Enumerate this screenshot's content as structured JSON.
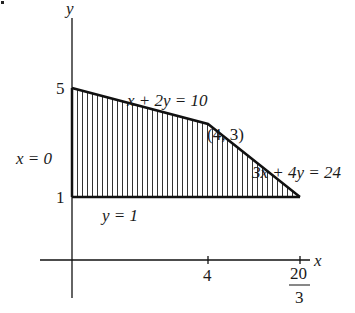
{
  "diagram": {
    "type": "feasible-region",
    "axes": {
      "x_label": "x",
      "y_label": "y",
      "x_ticks": [
        {
          "value": "4",
          "label": "4"
        },
        {
          "value": "20/3",
          "numerator": "20",
          "denominator": "3"
        }
      ],
      "y_ticks": [
        {
          "value": "5",
          "label": "5"
        },
        {
          "value": "1",
          "label": "1"
        }
      ]
    },
    "region": {
      "vertices": [
        [
          0,
          1
        ],
        [
          0,
          5
        ],
        [
          4,
          3
        ],
        [
          6.667,
          1
        ]
      ],
      "fill": "vertical-hatching",
      "stroke_color": "#111111"
    },
    "labels": {
      "line1": "x + 2y = 10",
      "line2": "3x + 4y = 24",
      "line_y1": "y = 1",
      "line_x0": "x = 0",
      "vertex": "(4, 3)"
    }
  }
}
